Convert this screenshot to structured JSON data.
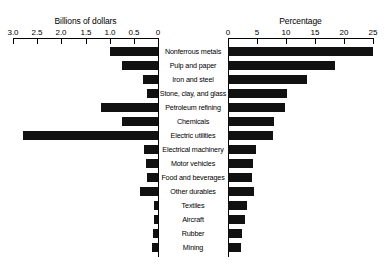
{
  "chart_data": {
    "type": "bar",
    "title": "",
    "orientation": "horizontal-bidirectional",
    "panels": [
      {
        "name": "left",
        "title": "Billions of dollars",
        "direction": "rightToLeft",
        "axis_ticks": [
          "3.0",
          "2.5",
          "2.0",
          "1.5",
          "1.0",
          "0.5",
          "0"
        ],
        "axis_tick_values": [
          3.0,
          2.5,
          2.0,
          1.5,
          1.0,
          0.5,
          0
        ],
        "xlim": [
          3.0,
          0
        ],
        "xlabel": "Billions of dollars",
        "grid": false
      },
      {
        "name": "right",
        "title": "Percentage",
        "direction": "leftToRight",
        "axis_ticks": [
          "0",
          "5",
          "10",
          "15",
          "20",
          "25"
        ],
        "axis_tick_values": [
          0,
          5,
          10,
          15,
          20,
          25
        ],
        "xlim": [
          0,
          25
        ],
        "xlabel": "Percentage",
        "grid": false
      }
    ],
    "categories": [
      "Nonferrous metals",
      "Pulp and paper",
      "Iron and steel",
      "Stone, clay, and glass",
      "Petroleum refining",
      "Chemicals",
      "Electric utilities",
      "Electrical machinery",
      "Motor vehicles",
      "Food and beverages",
      "Other durables",
      "Textiles",
      "Aircraft",
      "Rubber",
      "Mining"
    ],
    "series": [
      {
        "name": "Billions of dollars",
        "panel": "left",
        "unit": "billions of dollars",
        "values": [
          1.0,
          0.75,
          0.31,
          0.23,
          1.18,
          0.75,
          2.8,
          0.29,
          0.24,
          0.22,
          0.38,
          0.09,
          0.09,
          0.1,
          0.12
        ]
      },
      {
        "name": "Percentage",
        "panel": "right",
        "unit": "percent",
        "values": [
          25.0,
          18.5,
          13.7,
          10.2,
          9.8,
          8.0,
          7.8,
          4.8,
          4.3,
          4.2,
          4.5,
          3.2,
          3.0,
          2.4,
          2.3
        ]
      }
    ],
    "legend": [],
    "annotations": []
  },
  "colors": {
    "bar": "#111111",
    "axis": "#000000",
    "background": "#ffffff",
    "text": "#000000"
  }
}
